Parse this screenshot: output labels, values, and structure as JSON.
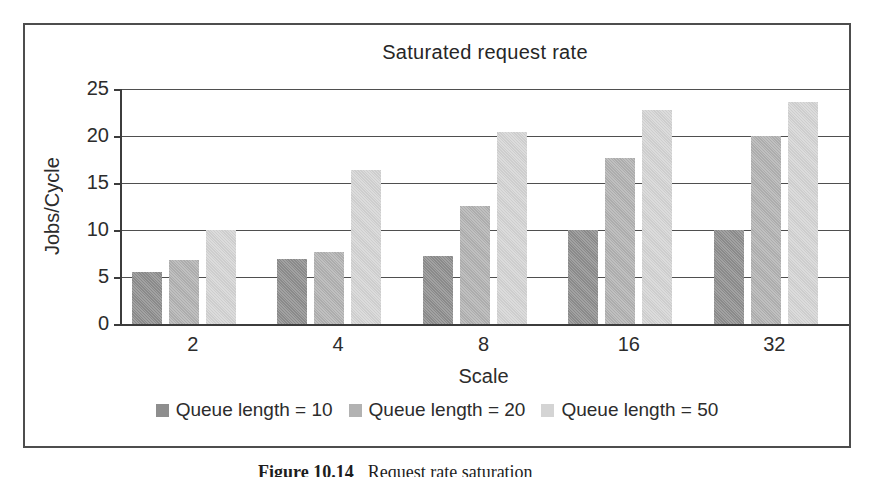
{
  "figure": {
    "caption_label": "Figure 10.14",
    "caption_text": "Request rate saturation"
  },
  "chart_data": {
    "type": "bar",
    "title": "Saturated request rate",
    "xlabel": "Scale",
    "ylabel": "Jobs/Cycle",
    "categories": [
      "2",
      "4",
      "8",
      "16",
      "32"
    ],
    "series": [
      {
        "name": "Queue length = 10",
        "color": "#8e8e8e",
        "values": [
          5.5,
          6.9,
          7.2,
          10.0,
          10.0
        ]
      },
      {
        "name": "Queue length = 20",
        "color": "#b2b2b2",
        "values": [
          6.8,
          7.7,
          12.6,
          17.7,
          20.0
        ]
      },
      {
        "name": "Queue length = 50",
        "color": "#d4d4d4",
        "values": [
          10.0,
          16.4,
          20.4,
          22.8,
          23.6
        ]
      }
    ],
    "ylim": [
      0,
      25
    ],
    "yticks": [
      0,
      5,
      10,
      15,
      20,
      25
    ],
    "grid": true,
    "legend_position": "bottom"
  }
}
